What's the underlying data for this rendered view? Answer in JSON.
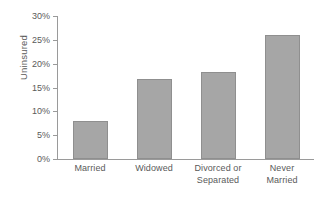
{
  "chart_data": {
    "type": "bar",
    "title": "",
    "subtitle": "",
    "xlabel": "",
    "ylabel": "Uninsured",
    "categories": [
      "Married",
      "Widowed",
      "Divorced or Separated",
      "Never Married"
    ],
    "category_lines": [
      [
        "Married"
      ],
      [
        "Widowed"
      ],
      [
        "Divorced or",
        "Separated"
      ],
      [
        "Never",
        "Married"
      ]
    ],
    "values": [
      8.0,
      16.8,
      18.3,
      26.0
    ],
    "value_labels": [
      "8%",
      "16.8%",
      "18.3%",
      "26%"
    ],
    "ylim": [
      0,
      30
    ],
    "ytick_values": [
      0,
      5,
      10,
      15,
      20,
      25,
      30
    ],
    "ytick_labels": [
      "0%",
      "5%",
      "10%",
      "15%",
      "20%",
      "25%",
      "30%"
    ],
    "grid": false,
    "legend": false,
    "legend_position": "none",
    "bar_color": "#a6a6a6",
    "bar_border_color": "#8f8f8f",
    "axis_color": "#9a9a9a",
    "text_color": "#5a5a5a",
    "background_color": "#ffffff"
  }
}
